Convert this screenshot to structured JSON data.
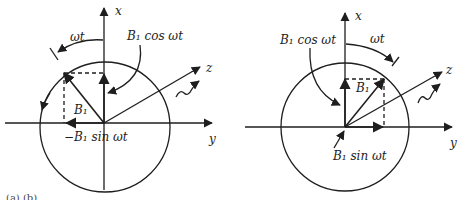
{
  "panels": [
    {
      "id": "left",
      "labels": {
        "x_axis": "x",
        "y_axis": "y",
        "z_axis": "z",
        "angle": "ωt",
        "vector": "B₁",
        "cos_component": "B₁ cos ωt",
        "sin_component": "−B₁ sin ωt"
      },
      "rotation_direction": "counterclockwise"
    },
    {
      "id": "right",
      "labels": {
        "x_axis": "x",
        "y_axis": "y",
        "z_axis": "z",
        "angle": "ωt",
        "vector": "B₁",
        "cos_component": "B₁ cos ωt",
        "sin_component": "B₁ sin ωt"
      },
      "rotation_direction": "clockwise"
    }
  ],
  "caption": "(a) (b)",
  "colors": {
    "ink": "#1e1e1e",
    "background": "#ffffff"
  }
}
